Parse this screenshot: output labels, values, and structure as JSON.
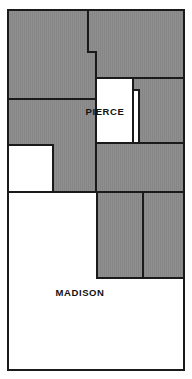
{
  "map": {
    "type": "county-boundary-map",
    "width": 192,
    "height": 379,
    "background_color": "#ffffff",
    "fill_shaded": "#8c8c8c",
    "fill_unshaded": "#ffffff",
    "stroke_color": "#1a1a1a",
    "frame": {
      "x": 8,
      "y": 10,
      "width": 176,
      "height": 360
    },
    "labels": [
      {
        "id": "pierce",
        "text": "PIERCE",
        "x": 105,
        "y": 112,
        "font_size": 9.5
      },
      {
        "id": "madison",
        "text": "MADISON",
        "x": 80,
        "y": 293,
        "font_size": 9.5
      }
    ],
    "regions": [
      {
        "id": "nw-shaded",
        "name": "northwest-shaded-region",
        "shaded": true,
        "points": "8,10 88,10 88,52 96,52 96,99 8,99"
      },
      {
        "id": "ne-shaded",
        "name": "northeast-shaded-region",
        "shaded": true,
        "points": "88,10 184,10 184,78 139,78 139,90 133,90 133,78 96,78 96,52 88,52"
      },
      {
        "id": "pierce-white",
        "name": "pierce-unshaded-region",
        "shaded": false,
        "points": "96,78 133,78 133,90 139,90 139,78 139,78 139,90 133,90 133,143 96,143"
      },
      {
        "id": "w-mid-shaded",
        "name": "west-middle-shaded-region",
        "shaded": true,
        "points": "8,99 96,99 96,192 53,192 53,145 8,145"
      },
      {
        "id": "w-mid-white",
        "name": "west-middle-unshaded-region",
        "shaded": false,
        "points": "8,145 53,145 53,192 8,192"
      },
      {
        "id": "e-mid-shaded",
        "name": "east-middle-shaded-region",
        "shaded": true,
        "points": "139,78 184,78 184,143 139,143 139,90 133,90 133,78"
      },
      {
        "id": "center-band-shaded",
        "name": "center-band-shaded-region",
        "shaded": true,
        "points": "96,143 184,143 184,192 96,192"
      },
      {
        "id": "s-left-shaded",
        "name": "south-left-shaded-region",
        "shaded": true,
        "points": "97,192 143,192 143,278 97,278"
      },
      {
        "id": "s-right-shaded",
        "name": "south-right-shaded-region",
        "shaded": true,
        "points": "143,192 184,192 184,278 143,278"
      },
      {
        "id": "madison-white",
        "name": "madison-unshaded-region",
        "shaded": false,
        "points": "8,192 97,192 97,278 184,278 184,370 8,370"
      }
    ],
    "internal_lines": [
      {
        "id": "line-nw-ne-top",
        "name": "divider-nw-ne-upper",
        "points": "88,10 88,52 96,52 96,78"
      },
      {
        "id": "line-right-upper",
        "name": "divider-right-upper",
        "points": "139,78 184,78"
      },
      {
        "id": "line-pierce-step",
        "name": "pierce-step-edge",
        "points": "133,78 133,90 139,90"
      },
      {
        "id": "line-left-mid",
        "name": "divider-left-middle",
        "points": "8,99 96,99"
      },
      {
        "id": "line-white-box",
        "name": "white-box-edge",
        "points": "8,145 53,145 53,192"
      },
      {
        "id": "line-center-band-top",
        "name": "divider-center-band-top",
        "points": "96,143 184,143"
      },
      {
        "id": "line-pierce-bottom",
        "name": "pierce-bottom-edge",
        "points": "96,143 96,192"
      },
      {
        "id": "line-mid-bottom",
        "name": "divider-middle-bottom",
        "points": "8,192 184,192"
      },
      {
        "id": "line-south-vert",
        "name": "divider-south-vertical",
        "points": "143,192 143,278"
      },
      {
        "id": "line-south-left",
        "name": "divider-south-left-vertical",
        "points": "97,192 97,278"
      },
      {
        "id": "line-south-bottom",
        "name": "divider-south-bottom",
        "points": "97,278 184,278"
      }
    ]
  }
}
